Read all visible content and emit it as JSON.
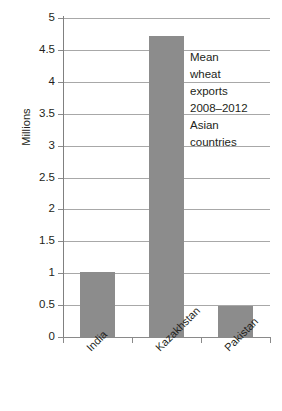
{
  "chart_data": {
    "type": "bar",
    "title": "",
    "categories": [
      "India",
      "Kazakhstan",
      "Pakistan"
    ],
    "values": [
      1.02,
      4.72,
      0.48
    ],
    "series": [
      {
        "name": "Mean wheat exports 2008-2012",
        "values": [
          1.02,
          4.72,
          0.48
        ]
      }
    ],
    "xlabel": "",
    "ylabel": "Millions",
    "ylim": [
      0,
      5
    ],
    "yticks": [
      0,
      0.5,
      1,
      1.5,
      2,
      2.5,
      3,
      3.5,
      4,
      4.5,
      5
    ],
    "ytick_labels": [
      "0",
      "0.5",
      "1",
      "1.5",
      "2",
      "2.5",
      "3",
      "3.5",
      "4",
      "4.5",
      "5"
    ],
    "grid": true,
    "legend": false,
    "bar_color": "#8c8c8c",
    "gridline_color": "#a8a8a8",
    "axis_color": "#8a8a8a",
    "background_color": "#ffffff",
    "annotations": [
      {
        "name": "chart-note",
        "lines": [
          "Mean",
          "wheat",
          "exports",
          "2008–2012",
          "Asian",
          "countries"
        ]
      }
    ]
  },
  "axis": {
    "y_title": "Millions"
  }
}
